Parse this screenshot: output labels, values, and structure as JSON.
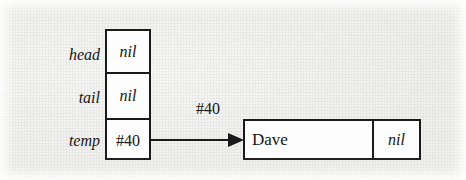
{
  "figure": {
    "kind": "linked-list-pointer-diagram",
    "background_color": "#f2f2f0",
    "ink_color": "#1a1a1a",
    "box_fill_color": "#fdfdfd"
  },
  "variable_stack": {
    "rows": [
      {
        "label": "head",
        "value": "nil",
        "value_style": "italic"
      },
      {
        "label": "tail",
        "value": "nil",
        "value_style": "italic"
      },
      {
        "label": "temp",
        "value": "#40",
        "value_style": "upright"
      }
    ]
  },
  "pointer": {
    "label": "#40",
    "from_row": "temp",
    "to_node": "dave-node"
  },
  "node": {
    "data": "Dave",
    "next": "nil"
  }
}
